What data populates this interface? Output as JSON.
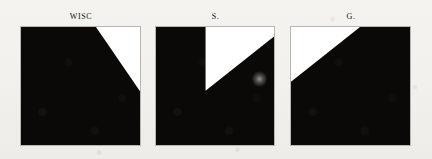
{
  "figure": {
    "background_color": "#f4f2ee",
    "panel_border_color": "#b9b6b0",
    "foreground_color": "#0a0907",
    "region_color": "#ffffff",
    "panel_count": 3
  },
  "panels": [
    {
      "label": "WISC",
      "region_name": "upper-right-triangle",
      "polygon": "63,0 100,0 100,54 63,0",
      "artifact": null
    },
    {
      "label": "S.",
      "region_name": "upper-middle-wedge",
      "polygon": "42,0 100,0 100,8 42,54 42,0",
      "artifact": {
        "name": "gray-blob",
        "cx_pct": 88,
        "cy_pct": 44,
        "w_pct": 13,
        "h_pct": 14
      }
    },
    {
      "label": "G.",
      "region_name": "upper-left-triangle",
      "polygon": "0,0 58,0 0,46 0,0",
      "artifact": null
    }
  ]
}
